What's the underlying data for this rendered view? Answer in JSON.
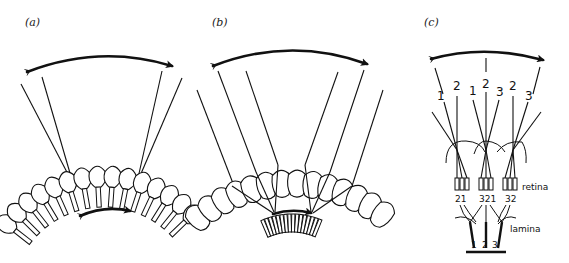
{
  "figure": {
    "panels": [
      {
        "id": "a",
        "label": "(a)"
      },
      {
        "id": "b",
        "label": "(b)"
      },
      {
        "id": "c",
        "label": "(c)"
      }
    ],
    "panel_c": {
      "ray_numbers": [
        "1",
        "2",
        "1",
        "2",
        "3",
        "2",
        "3"
      ],
      "receptor_groups": [
        "21",
        "321",
        "32"
      ],
      "lamina_numbers": [
        "1",
        "2",
        "3"
      ],
      "retina_label": "retina",
      "lamina_label": "lamina"
    }
  }
}
